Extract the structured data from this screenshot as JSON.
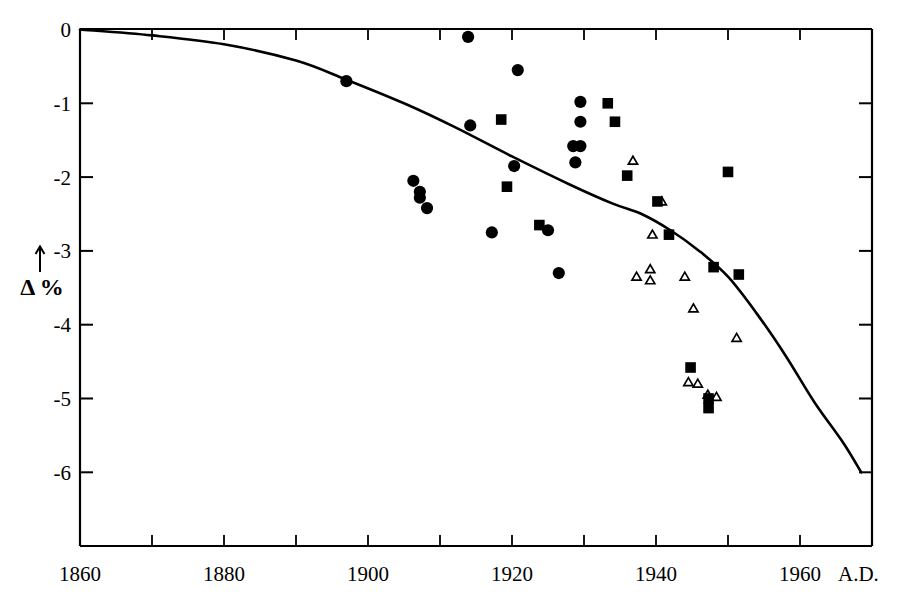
{
  "chart_data": {
    "type": "scatter",
    "title": "",
    "subtitle": "",
    "xlabel": "",
    "ylabel": "Δ %",
    "ylabel_arrow": "↑",
    "x_suffix": "A.D.",
    "xlim": [
      1860,
      1970
    ],
    "ylim": [
      -6.45,
      0
    ],
    "x_ticks": [
      1860,
      1880,
      1900,
      1920,
      1940,
      1960
    ],
    "x_tick_labels": [
      "1860",
      "1880",
      "1900",
      "1920",
      "1940",
      "1960"
    ],
    "x_minor_tick_interval": 10,
    "y_ticks": [
      0,
      -1,
      -2,
      -3,
      -4,
      -5,
      -6
    ],
    "y_tick_labels": [
      "0",
      "-1",
      "-2",
      "-3",
      "-4",
      "-5",
      "-6"
    ],
    "grid": false,
    "legend": "none",
    "series": [
      {
        "name": "filled-circles",
        "marker": "circle",
        "fill": "#000000",
        "points": [
          [
            1897.0,
            -0.7
          ],
          [
            1913.9,
            -0.1
          ],
          [
            1914.2,
            -1.3
          ],
          [
            1920.3,
            -1.85
          ],
          [
            1917.2,
            -2.75
          ],
          [
            1906.3,
            -2.05
          ],
          [
            1907.2,
            -2.2
          ],
          [
            1907.2,
            -2.28
          ],
          [
            1908.2,
            -2.42
          ],
          [
            1925.0,
            -2.72
          ],
          [
            1926.5,
            -3.3
          ],
          [
            1920.8,
            -0.55
          ],
          [
            1929.5,
            -0.98
          ],
          [
            1929.5,
            -1.25
          ],
          [
            1928.5,
            -1.58
          ],
          [
            1929.5,
            -1.58
          ],
          [
            1928.8,
            -1.8
          ]
        ]
      },
      {
        "name": "filled-squares",
        "marker": "square",
        "fill": "#000000",
        "points": [
          [
            1918.5,
            -1.22
          ],
          [
            1933.3,
            -1.0
          ],
          [
            1934.3,
            -1.25
          ],
          [
            1919.3,
            -2.13
          ],
          [
            1923.8,
            -2.65
          ],
          [
            1936.0,
            -1.98
          ],
          [
            1940.2,
            -2.33
          ],
          [
            1941.8,
            -2.78
          ],
          [
            1950.0,
            -1.93
          ],
          [
            1948.0,
            -3.22
          ],
          [
            1951.5,
            -3.32
          ],
          [
            1944.8,
            -4.58
          ],
          [
            1947.3,
            -5.0
          ],
          [
            1947.3,
            -5.13
          ]
        ]
      },
      {
        "name": "open-triangles",
        "marker": "triangle",
        "fill": "none",
        "points": [
          [
            1936.8,
            -1.78
          ],
          [
            1940.8,
            -2.33
          ],
          [
            1939.5,
            -2.78
          ],
          [
            1937.3,
            -3.35
          ],
          [
            1939.2,
            -3.25
          ],
          [
            1939.2,
            -3.4
          ],
          [
            1944.0,
            -3.35
          ],
          [
            1945.2,
            -3.78
          ],
          [
            1944.5,
            -4.78
          ],
          [
            1945.8,
            -4.8
          ],
          [
            1947.2,
            -4.95
          ],
          [
            1948.4,
            -4.98
          ],
          [
            1951.2,
            -4.18
          ]
        ]
      }
    ],
    "trend_curve": {
      "name": "smooth-trend-line",
      "points": [
        [
          1860.0,
          0.0
        ],
        [
          1870.0,
          -0.08
        ],
        [
          1880.0,
          -0.2
        ],
        [
          1890.0,
          -0.42
        ],
        [
          1897.0,
          -0.68
        ],
        [
          1905.0,
          -1.0
        ],
        [
          1912.0,
          -1.32
        ],
        [
          1920.0,
          -1.72
        ],
        [
          1928.0,
          -2.1
        ],
        [
          1934.0,
          -2.36
        ],
        [
          1938.0,
          -2.5
        ],
        [
          1942.0,
          -2.72
        ],
        [
          1946.0,
          -3.0
        ],
        [
          1950.0,
          -3.35
        ],
        [
          1954.0,
          -3.85
        ],
        [
          1958.0,
          -4.42
        ],
        [
          1962.0,
          -5.05
        ],
        [
          1966.0,
          -5.6
        ],
        [
          1968.5,
          -6.0
        ]
      ]
    }
  }
}
